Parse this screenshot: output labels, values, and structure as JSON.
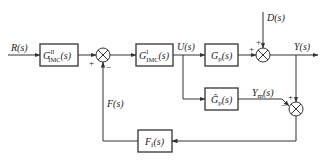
{
  "diagram": {
    "title": "",
    "signals": {
      "input": "R(s)",
      "control": "U(s)",
      "disturbance": "D(s)",
      "output": "Y(s)",
      "model_output": "Y",
      "model_output_sub": "m",
      "model_output_tail": "(s)",
      "feedback": "F(s)"
    },
    "blocks": {
      "gimc2": {
        "base": "G",
        "sup": "II",
        "sub": "IMC",
        "tail": "(s)"
      },
      "gimc1": {
        "base": "G",
        "sup": "I",
        "sub": "IMC",
        "tail": "(s)"
      },
      "plant": {
        "base": "G",
        "sub": "p",
        "tail": "(s)"
      },
      "model": {
        "base": "Ĝ",
        "sub": "p",
        "tail": "(s)"
      },
      "filter": {
        "base": "F",
        "sub": "f",
        "tail": "(s)"
      }
    },
    "signs": {
      "sum1_left": "+",
      "sum1_bottom": "−",
      "sum2_left": "+",
      "sum2_top": "+",
      "sum3_top": "+",
      "sum3_left": "−"
    },
    "colors": {
      "line": "#333333",
      "background": "#ffffff"
    }
  }
}
